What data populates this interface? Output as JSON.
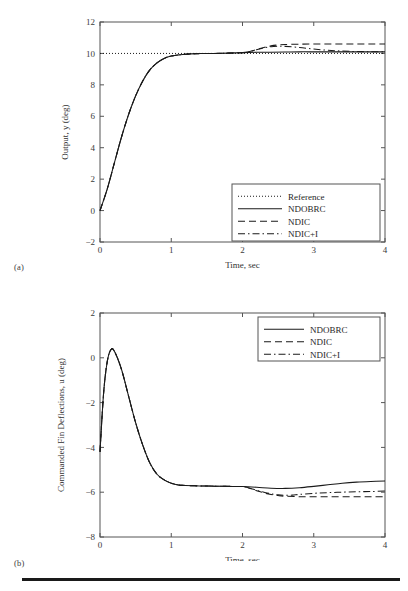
{
  "figure": {
    "sublabel_a": "(a)",
    "sublabel_b": "(b)"
  },
  "chart_data": [
    {
      "panel": "(a)",
      "type": "line",
      "title": "",
      "xlabel": "Time, sec",
      "ylabel": "Output, y (deg)",
      "xlim": [
        0,
        4
      ],
      "ylim": [
        -2,
        12
      ],
      "xticks": [
        "0",
        "1",
        "2",
        "3",
        "4"
      ],
      "yticks": [
        "-2",
        "0",
        "2",
        "4",
        "6",
        "8",
        "10",
        "12"
      ],
      "grid": false,
      "legend_position": "lower right",
      "legend": [
        "Reference",
        "NDOBRC",
        "NDIC",
        "NDIC+I"
      ],
      "series": [
        {
          "name": "Reference",
          "style": "dotted",
          "x": [
            0,
            4
          ],
          "values": [
            10,
            10
          ]
        },
        {
          "name": "NDOBRC",
          "style": "solid",
          "x": [
            0,
            0.1,
            0.2,
            0.3,
            0.4,
            0.5,
            0.6,
            0.7,
            0.8,
            0.9,
            1.0,
            1.2,
            1.4,
            1.6,
            1.8,
            2.0,
            2.2,
            2.4,
            2.6,
            2.8,
            3.0,
            3.2,
            3.4,
            3.6,
            3.8,
            4.0
          ],
          "values": [
            0.0,
            1.35,
            3.0,
            4.65,
            6.1,
            7.3,
            8.25,
            8.95,
            9.4,
            9.68,
            9.83,
            9.95,
            9.99,
            10.0,
            10.02,
            10.05,
            10.07,
            10.08,
            10.09,
            10.1,
            10.1,
            10.1,
            10.1,
            10.1,
            10.1,
            10.1
          ]
        },
        {
          "name": "NDIC",
          "style": "dashed",
          "x": [
            0,
            0.1,
            0.2,
            0.3,
            0.4,
            0.5,
            0.6,
            0.7,
            0.8,
            0.9,
            1.0,
            1.2,
            1.4,
            1.6,
            1.8,
            2.0,
            2.1,
            2.2,
            2.3,
            2.4,
            2.5,
            2.6,
            2.8,
            3.0,
            3.2,
            3.4,
            3.6,
            3.8,
            4.0
          ],
          "values": [
            0.0,
            1.35,
            3.0,
            4.65,
            6.1,
            7.3,
            8.25,
            8.95,
            9.4,
            9.68,
            9.83,
            9.95,
            9.99,
            10.0,
            10.02,
            10.05,
            10.12,
            10.25,
            10.38,
            10.48,
            10.54,
            10.57,
            10.59,
            10.6,
            10.6,
            10.6,
            10.6,
            10.6,
            10.6
          ]
        },
        {
          "name": "NDIC+I",
          "style": "dashdot",
          "x": [
            0,
            0.1,
            0.2,
            0.3,
            0.4,
            0.5,
            0.6,
            0.7,
            0.8,
            0.9,
            1.0,
            1.2,
            1.4,
            1.6,
            1.8,
            2.0,
            2.1,
            2.2,
            2.3,
            2.4,
            2.5,
            2.6,
            2.8,
            3.0,
            3.2,
            3.4,
            3.6,
            3.8,
            4.0
          ],
          "values": [
            0.0,
            1.35,
            3.0,
            4.65,
            6.1,
            7.3,
            8.25,
            8.95,
            9.4,
            9.68,
            9.83,
            9.95,
            9.99,
            10.0,
            10.02,
            10.05,
            10.12,
            10.24,
            10.35,
            10.43,
            10.46,
            10.45,
            10.38,
            10.28,
            10.2,
            10.15,
            10.12,
            10.11,
            10.1
          ]
        }
      ]
    },
    {
      "panel": "(b)",
      "type": "line",
      "title": "",
      "xlabel": "Time, sec",
      "ylabel": "Commanded Fin Deflections, u (deg)",
      "xlim": [
        0,
        4
      ],
      "ylim": [
        -8,
        2
      ],
      "xticks": [
        "0",
        "1",
        "2",
        "3",
        "4"
      ],
      "yticks": [
        "-8",
        "-6",
        "-4",
        "-2",
        "0",
        "2"
      ],
      "grid": false,
      "legend_position": "upper right",
      "legend": [
        "NDOBRC",
        "NDIC",
        "NDIC+I"
      ],
      "series": [
        {
          "name": "NDOBRC",
          "style": "solid",
          "x": [
            0,
            0.05,
            0.1,
            0.15,
            0.2,
            0.3,
            0.4,
            0.5,
            0.6,
            0.7,
            0.8,
            0.9,
            1.0,
            1.1,
            1.2,
            1.4,
            1.6,
            1.8,
            2.0,
            2.2,
            2.4,
            2.6,
            2.8,
            3.0,
            3.2,
            3.4,
            3.6,
            3.8,
            4.0
          ],
          "values": [
            -4.2,
            -1.6,
            -0.2,
            0.35,
            0.3,
            -0.5,
            -1.7,
            -2.9,
            -3.9,
            -4.7,
            -5.2,
            -5.45,
            -5.6,
            -5.68,
            -5.7,
            -5.72,
            -5.73,
            -5.74,
            -5.75,
            -5.78,
            -5.82,
            -5.83,
            -5.8,
            -5.74,
            -5.67,
            -5.6,
            -5.55,
            -5.52,
            -5.5
          ]
        },
        {
          "name": "NDIC",
          "style": "dashed",
          "x": [
            0,
            0.05,
            0.1,
            0.15,
            0.2,
            0.3,
            0.4,
            0.5,
            0.6,
            0.7,
            0.8,
            0.9,
            1.0,
            1.1,
            1.2,
            1.4,
            1.6,
            1.8,
            2.0,
            2.1,
            2.2,
            2.3,
            2.4,
            2.5,
            2.6,
            2.8,
            3.0,
            3.2,
            3.4,
            3.6,
            3.8,
            4.0
          ],
          "values": [
            -4.2,
            -1.6,
            -0.2,
            0.35,
            0.3,
            -0.5,
            -1.7,
            -2.9,
            -3.9,
            -4.7,
            -5.2,
            -5.45,
            -5.6,
            -5.68,
            -5.7,
            -5.72,
            -5.73,
            -5.74,
            -5.75,
            -5.82,
            -5.93,
            -6.03,
            -6.1,
            -6.15,
            -6.18,
            -6.2,
            -6.2,
            -6.2,
            -6.2,
            -6.2,
            -6.2,
            -6.2
          ]
        },
        {
          "name": "NDIC+I",
          "style": "dashdot",
          "x": [
            0,
            0.05,
            0.1,
            0.15,
            0.2,
            0.3,
            0.4,
            0.5,
            0.6,
            0.7,
            0.8,
            0.9,
            1.0,
            1.1,
            1.2,
            1.4,
            1.6,
            1.8,
            2.0,
            2.1,
            2.2,
            2.3,
            2.4,
            2.5,
            2.6,
            2.7,
            2.8,
            3.0,
            3.2,
            3.4,
            3.6,
            3.8,
            4.0
          ],
          "values": [
            -4.2,
            -1.6,
            -0.2,
            0.35,
            0.3,
            -0.5,
            -1.7,
            -2.9,
            -3.9,
            -4.7,
            -5.2,
            -5.45,
            -5.6,
            -5.68,
            -5.7,
            -5.72,
            -5.73,
            -5.74,
            -5.75,
            -5.82,
            -5.92,
            -6.0,
            -6.07,
            -6.12,
            -6.14,
            -6.13,
            -6.1,
            -6.05,
            -6.02,
            -6.0,
            -5.98,
            -5.97,
            -5.95
          ]
        }
      ]
    }
  ]
}
